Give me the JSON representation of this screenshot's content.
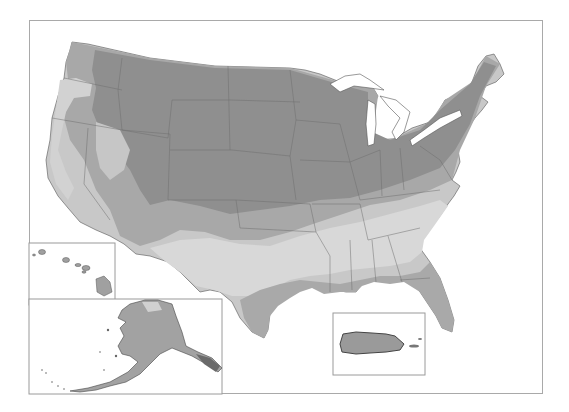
{
  "map": {
    "subject": "USDA Plant Hardiness Zone Map (grayscale)",
    "regions": [
      "contiguous-us",
      "hawaii",
      "alaska",
      "puerto-rico"
    ],
    "insets": [
      {
        "name": "hawaii",
        "x": 29,
        "y": 243,
        "w": 87,
        "h": 62
      },
      {
        "name": "alaska",
        "x": 29,
        "y": 299,
        "w": 194,
        "h": 95
      },
      {
        "name": "puerto-rico",
        "x": 333,
        "y": 313,
        "w": 92,
        "h": 62
      }
    ],
    "colors": {
      "background": "#ffffff",
      "frame": "#a9a9a9",
      "zone_cold": "#8e8e8e",
      "zone_mid": "#a6a6a6",
      "zone_warm": "#c4c4c4",
      "zone_hot": "#dadada",
      "zone_tropical": "#9c9c9c",
      "state_border": "#6e6e6e",
      "water": "#ffffff",
      "coastline": "#333333"
    }
  }
}
